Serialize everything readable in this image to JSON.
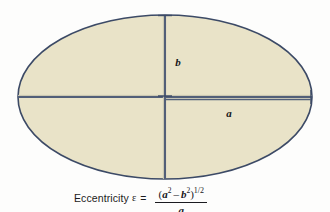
{
  "figure": {
    "shape": "ellipse",
    "fill_color": "#e9e3c8",
    "stroke_color": "#3c4a66",
    "background_color": "#fdfdfc",
    "center": {
      "x": 165,
      "y": 97
    },
    "semi_major_axis_px": 147,
    "semi_minor_axis_px": 82,
    "labels": {
      "semi_minor": "b",
      "semi_major": "a"
    }
  },
  "caption": {
    "text": "Eccentricity",
    "symbol": "ε",
    "equals": "=",
    "numerator_open": "(",
    "numerator_a": "a",
    "numerator_a_exp": "2",
    "numerator_minus": "–",
    "numerator_b": "b",
    "numerator_b_exp": "2",
    "numerator_close": ")",
    "numerator_exp_num": "1",
    "numerator_exp_slash": "/",
    "numerator_exp_den": "2",
    "denominator": "a",
    "full": "Eccentricity ε = (a² – b²)^1/2 / a"
  }
}
